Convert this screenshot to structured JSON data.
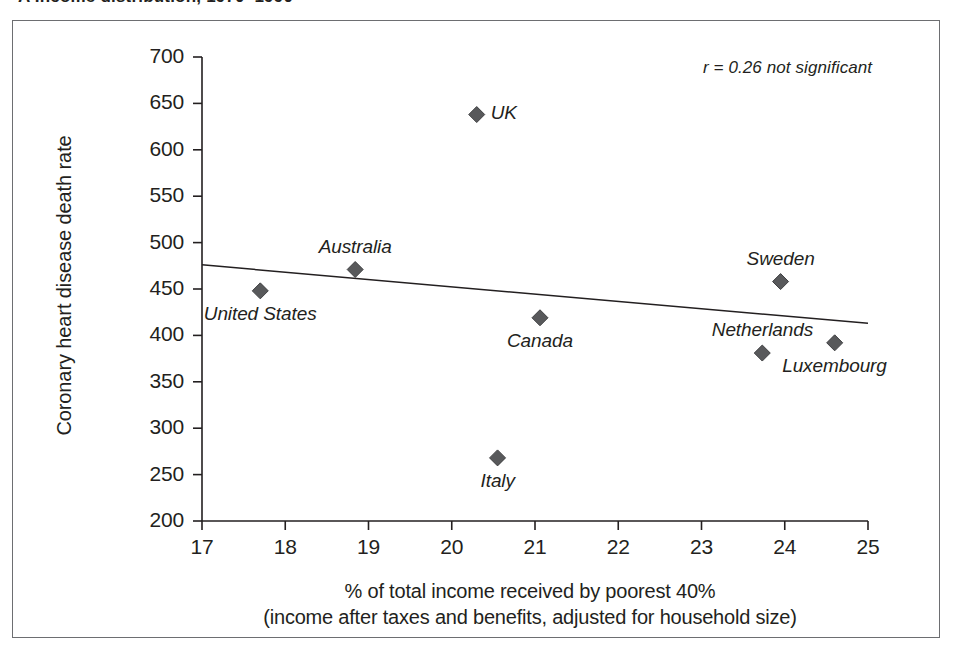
{
  "caption": {
    "text": "A   Income distribution, 1970–1990"
  },
  "chart_data": {
    "type": "scatter",
    "title": "",
    "xlabel": "% of total income received by poorest 40%",
    "xlabel_line2": "(income after taxes and benefits, adjusted for household size)",
    "ylabel": "Coronary heart disease death rate",
    "xlim": [
      17,
      25
    ],
    "ylim": [
      200,
      700
    ],
    "xticks": [
      17,
      18,
      19,
      20,
      21,
      22,
      23,
      24,
      25
    ],
    "yticks": [
      200,
      250,
      300,
      350,
      400,
      450,
      500,
      550,
      600,
      650,
      700
    ],
    "grid": false,
    "legend": "none",
    "annotation": "r = 0.26 not significant",
    "marker_shape": "diamond",
    "marker_color": "#58595b",
    "points": [
      {
        "label": "United States",
        "x": 17.7,
        "y": 448,
        "label_pos": "below"
      },
      {
        "label": "Australia",
        "x": 18.84,
        "y": 471,
        "label_pos": "above"
      },
      {
        "label": "UK",
        "x": 20.3,
        "y": 638,
        "label_pos": "right"
      },
      {
        "label": "Italy",
        "x": 20.55,
        "y": 268,
        "label_pos": "below"
      },
      {
        "label": "Canada",
        "x": 21.06,
        "y": 419,
        "label_pos": "below"
      },
      {
        "label": "Netherlands",
        "x": 23.73,
        "y": 381,
        "label_pos": "above"
      },
      {
        "label": "Sweden",
        "x": 23.95,
        "y": 458,
        "label_pos": "above"
      },
      {
        "label": "Luxembourg",
        "x": 24.6,
        "y": 392,
        "label_pos": "below"
      }
    ],
    "trendline": {
      "x_start": 17,
      "y_start": 476,
      "x_end": 25,
      "y_end": 413
    },
    "colors": {
      "axis": "#231f20",
      "marker": "#58595b",
      "trendline": "#231f20",
      "frame": "#6d6e71",
      "text": "#231f20"
    }
  }
}
